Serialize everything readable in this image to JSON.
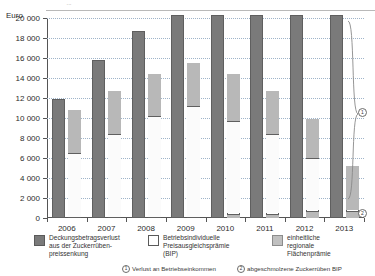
{
  "top_partial_text": "...",
  "axis_unit_label": "Euro",
  "chart_data": {
    "type": "bar",
    "title": "",
    "subtitle": "",
    "xlabel": "",
    "ylabel": "Euro",
    "ylim": [
      0,
      20000
    ],
    "ytick_step": 2000,
    "ytick_labels": [
      "0",
      "2 000",
      "4 000",
      "6 000",
      "8 000",
      "10 000",
      "12 000",
      "14 000",
      "16 000",
      "18 000",
      "20 000"
    ],
    "ytick_values": [
      0,
      2000,
      4000,
      6000,
      8000,
      10000,
      12000,
      14000,
      16000,
      18000,
      20000
    ],
    "grid": true,
    "grid_style": "dotted",
    "legend_position": "bottom",
    "categories": [
      "2006",
      "2007",
      "2008",
      "2009",
      "2010",
      "2011",
      "2012",
      "2013"
    ],
    "series": [
      {
        "name": "Deckungsbetragsverlust aus der Zuckerrübenpreissenkung",
        "color": "#7a7a7a",
        "values": [
          11900,
          15800,
          18700,
          20300,
          20300,
          20300,
          20300,
          20300
        ],
        "clipped_at_top": [
          false,
          false,
          false,
          true,
          true,
          true,
          true,
          true
        ]
      },
      {
        "name": "Betriebsindividuelle Preisausgleichsprämie (BIP)",
        "color": "#ffffff",
        "values": [
          6400,
          8300,
          10100,
          11100,
          9600,
          8300,
          5900,
          0
        ],
        "note": "white stacked segment, bottom of right bar (above regional premium where present)"
      },
      {
        "name": "einheitliche regionale Flächenprämie",
        "color": "#b8b8b8",
        "values": [
          4300,
          4300,
          4200,
          4300,
          4300,
          3900,
          3200,
          4400
        ],
        "note": "grey segment; from 2010 onward a small grey base of ~400-700 Euro also sits at the bottom"
      }
    ],
    "stacked_bar_totals": [
      10700,
      12600,
      14300,
      15400,
      14300,
      12600,
      9800,
      5100
    ],
    "base_segment": {
      "name": "abgeschmolzene Zuckerrüben BIP (base)",
      "values": [
        0,
        0,
        0,
        0,
        400,
        400,
        700,
        700
      ]
    },
    "annotations": [
      {
        "mark": "1",
        "label": "Verlust an Betriebseinkommen",
        "target_year": "2013",
        "描述": "brace spanning gap between loss bar and premium bar"
      },
      {
        "mark": "2",
        "label": "abgeschmolzene Zuckerrüben BIP",
        "target_year": "2013",
        "描述": "small grey base segment at bottom of 2013 premium bar"
      }
    ]
  },
  "legend": {
    "items": [
      {
        "swatch": "dark-grey",
        "label": "Deckungsbetragsverlust\naus der Zuckerrüben-\npreissenkung"
      },
      {
        "swatch": "white",
        "label": "Betriebsindividuelle\nPreisausgleichsprämie\n(BIP)"
      },
      {
        "swatch": "light-grey",
        "label": "einheitliche\nregionale\nFlächenprämie"
      }
    ]
  },
  "footnotes": [
    {
      "mark": "1",
      "text": "Verlust an Betriebseinkommen"
    },
    {
      "mark": "2",
      "text": "abgeschmolzene Zuckerrüben BIP"
    }
  ],
  "brace_notes": [
    {
      "mark": "1"
    },
    {
      "mark": "2"
    }
  ]
}
